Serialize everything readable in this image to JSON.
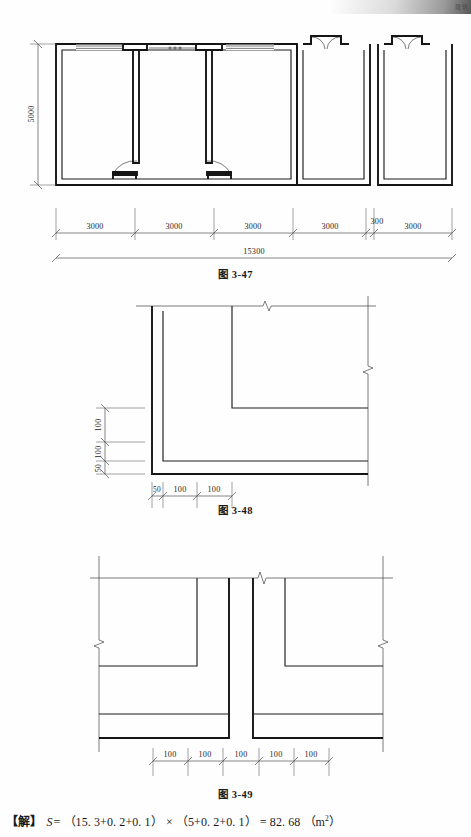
{
  "page": {
    "header_mark": "建筑",
    "solution": {
      "label": "【解】",
      "variable": "S",
      "equals": "=",
      "term_1": "（15. 3+0. 2+0. 1）",
      "times": "×",
      "term_2": "（5+0. 2+0. 1）",
      "result_equals": "=",
      "result": "82. 68",
      "unit_open": "（m",
      "unit_exp": "2",
      "unit_close": "）"
    }
  },
  "figures": [
    {
      "id": "fig-3-47",
      "caption": "图 3-47",
      "type": "floor-plan",
      "vertical_dimension": "5000",
      "horizontal_dimensions": [
        "3000",
        "3000",
        "3000",
        "3000",
        "300",
        "3000"
      ],
      "overall_dimension": "15300",
      "rooms": 5,
      "features": [
        "windows",
        "single-doors",
        "double-doors",
        "expansion-joint"
      ]
    },
    {
      "id": "fig-3-48",
      "caption": "图 3-48",
      "type": "foundation-corner-detail",
      "vertical_dimensions": [
        "100",
        "100",
        "50"
      ],
      "horizontal_dimensions": [
        "50",
        "100",
        "100"
      ]
    },
    {
      "id": "fig-3-49",
      "caption": "图 3-49",
      "type": "foundation-section",
      "horizontal_dimensions": [
        "100",
        "100",
        "100",
        "100",
        "100"
      ]
    }
  ]
}
